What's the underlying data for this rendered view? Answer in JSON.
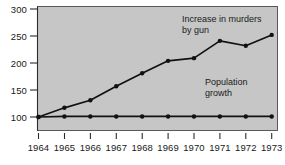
{
  "chart_data": {
    "type": "line",
    "title": "",
    "subtitle": "",
    "xlabel": "",
    "ylabel": "",
    "x": [
      1964,
      1965,
      1966,
      1967,
      1968,
      1969,
      1970,
      1971,
      1972,
      1973
    ],
    "categories": [
      "1964",
      "1965",
      "1966",
      "1967",
      "1968",
      "1969",
      "1970",
      "1971",
      "1972",
      "1973"
    ],
    "series": [
      {
        "name": "Increase in murders by gun",
        "values": [
          100,
          117,
          131,
          157,
          181,
          204,
          209,
          241,
          232,
          252
        ],
        "color": "#111111",
        "marker": "filled-circle"
      },
      {
        "name": "Population growth",
        "values": [
          100,
          101,
          101,
          101,
          101,
          101,
          101,
          101,
          101,
          101
        ],
        "color": "#111111",
        "marker": "filled-circle"
      }
    ],
    "ylim": [
      95,
      300
    ],
    "xlim": [
      1964,
      1973
    ],
    "yticks": [
      100,
      150,
      200,
      250,
      300
    ],
    "ytick_labels": [
      "100",
      "150",
      "200",
      "250",
      "300"
    ],
    "xtick_labels": [
      "1964",
      "1965",
      "1966",
      "1967",
      "1968",
      "1969",
      "1970",
      "1971",
      "1972",
      "1973"
    ],
    "grid": false,
    "legend": "inline-annotations",
    "plot_background": "#c6c6c6",
    "figure_background": "#ffffff",
    "annotations": [
      {
        "id": "murders-annotation",
        "line1": "Increase in murders",
        "line2": "by gun",
        "x": 182,
        "y": 22
      },
      {
        "id": "population-annotation",
        "line1": "Population",
        "line2": "growth",
        "x": 205,
        "y": 85
      }
    ]
  },
  "axes": {
    "y_ticks": [
      {
        "label": "300",
        "value": 300
      },
      {
        "label": "250",
        "value": 250
      },
      {
        "label": "200",
        "value": 200
      },
      {
        "label": "150",
        "value": 150
      },
      {
        "label": "100",
        "value": 100
      }
    ],
    "x_ticks": [
      {
        "label": "1964"
      },
      {
        "label": "1965"
      },
      {
        "label": "1966"
      },
      {
        "label": "1967"
      },
      {
        "label": "1968"
      },
      {
        "label": "1969"
      },
      {
        "label": "1970"
      },
      {
        "label": "1971"
      },
      {
        "label": "1972"
      },
      {
        "label": "1973"
      }
    ]
  }
}
